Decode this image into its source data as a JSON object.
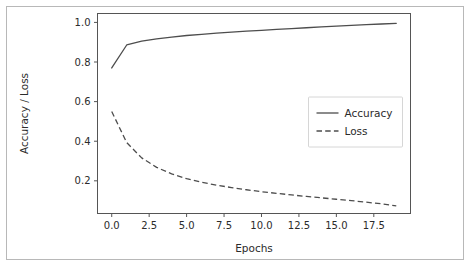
{
  "figure": {
    "width": 472,
    "height": 267,
    "background_color": "#ffffff",
    "frame_color": "#b8b8b8",
    "axis_color": "#555555",
    "text_color": "#2b2b2b"
  },
  "chart_data": {
    "type": "line",
    "title": "",
    "xlabel": "Epochs",
    "ylabel": "Accuracy / Loss",
    "xlim": [
      -0.95,
      19.95
    ],
    "ylim": [
      0.035,
      1.045
    ],
    "xticks": [
      0.0,
      2.5,
      5.0,
      7.5,
      10.0,
      12.5,
      15.0,
      17.5
    ],
    "xticklabels": [
      "0.0",
      "2.5",
      "5.0",
      "7.5",
      "10.0",
      "12.5",
      "15.0",
      "17.5"
    ],
    "yticks": [
      0.2,
      0.4,
      0.6,
      0.8,
      1.0
    ],
    "yticklabels": [
      "0.2",
      "0.4",
      "0.6",
      "0.8",
      "1.0"
    ],
    "grid": false,
    "legend_position": "center right",
    "x": [
      0,
      1,
      2,
      3,
      4,
      5,
      6,
      7,
      8,
      9,
      10,
      11,
      12,
      13,
      14,
      15,
      16,
      17,
      18,
      19
    ],
    "series": [
      {
        "name": "Accuracy",
        "linestyle": "solid",
        "color": "#4d4d4d",
        "values": [
          0.77,
          0.886,
          0.905,
          0.917,
          0.926,
          0.934,
          0.94,
          0.946,
          0.951,
          0.956,
          0.96,
          0.965,
          0.969,
          0.973,
          0.977,
          0.981,
          0.985,
          0.989,
          0.992,
          0.995
        ]
      },
      {
        "name": "Loss",
        "linestyle": "dashed",
        "color": "#4d4d4d",
        "values": [
          0.55,
          0.393,
          0.316,
          0.268,
          0.235,
          0.211,
          0.193,
          0.178,
          0.166,
          0.155,
          0.145,
          0.137,
          0.129,
          0.121,
          0.114,
          0.107,
          0.1,
          0.092,
          0.084,
          0.073
        ]
      }
    ]
  },
  "legend": {
    "items": [
      {
        "label": "Accuracy",
        "style": "solid"
      },
      {
        "label": "Loss",
        "style": "dashed"
      }
    ]
  }
}
